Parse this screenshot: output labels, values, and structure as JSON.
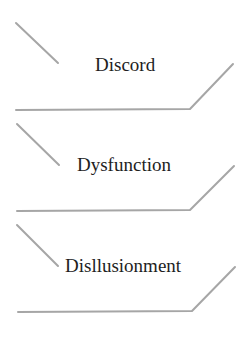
{
  "diagram": {
    "items": [
      {
        "label": "Discord"
      },
      {
        "label": "Dysfunction"
      },
      {
        "label": "Disllusionment"
      }
    ],
    "colors": {
      "line": "#a6a6a6",
      "text": "#1e1e1e",
      "background": "#ffffff"
    }
  }
}
